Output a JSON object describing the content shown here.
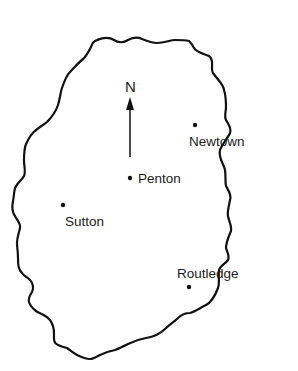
{
  "map": {
    "title": "",
    "compass": {
      "label": "N",
      "icon": "north-arrow-icon"
    },
    "towns": [
      {
        "name": "Newtown",
        "x": 195,
        "y": 125
      },
      {
        "name": "Penton",
        "x": 130,
        "y": 178
      },
      {
        "name": "Sutton",
        "x": 63,
        "y": 205
      },
      {
        "name": "Routledge",
        "x": 189,
        "y": 287
      }
    ],
    "colors": {
      "ink": "#111111",
      "background": "#ffffff"
    }
  }
}
